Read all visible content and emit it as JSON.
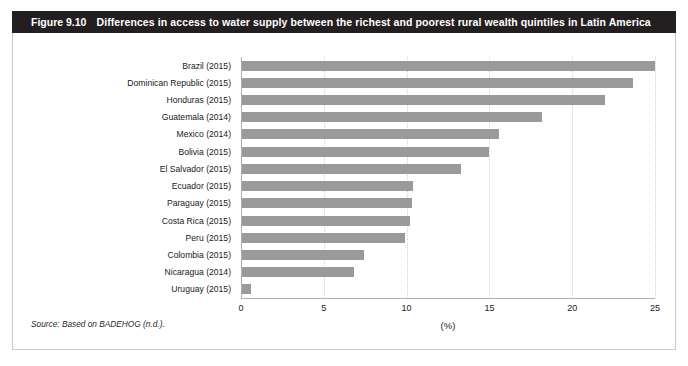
{
  "figure": {
    "number": "Figure 9.10",
    "title": "Differences in access to water supply between the richest and poorest rural wealth quintiles in Latin America",
    "source_note": "Source: Based on BADEHOG (n.d.)."
  },
  "colors": {
    "header_bg": "#231f20",
    "header_text": "#ffffff",
    "bar": "#9a9a9a",
    "frame_border": "#c9c9c9",
    "gridline": "#d3d3d3",
    "axis": "#b0b0b0"
  },
  "chart_data": {
    "type": "bar",
    "orientation": "horizontal",
    "title": "Differences in access to water supply between the richest and poorest rural wealth quintiles in Latin America",
    "xlabel": "(%)",
    "ylabel": "",
    "xlim": [
      0,
      25
    ],
    "xticks": [
      0,
      5,
      10,
      15,
      20,
      25
    ],
    "xtick_labels": [
      "0",
      "5",
      "10",
      "15",
      "20",
      "25"
    ],
    "grid": true,
    "legend": "none",
    "categories": [
      "Brazil (2015)",
      "Dominican Republic (2015)",
      "Honduras (2015)",
      "Guatemala (2014)",
      "Mexico (2014)",
      "Bolivia (2015)",
      "El Salvador (2015)",
      "Ecuador (2015)",
      "Paraguay (2015)",
      "Costa Rica (2015)",
      "Peru (2015)",
      "Colombia (2015)",
      "Nicaragua (2014)",
      "Uruguay (2015)"
    ],
    "values": [
      25.0,
      23.7,
      22.0,
      18.2,
      15.6,
      15.0,
      13.3,
      10.4,
      10.3,
      10.2,
      9.9,
      7.4,
      6.8,
      0.6
    ]
  }
}
